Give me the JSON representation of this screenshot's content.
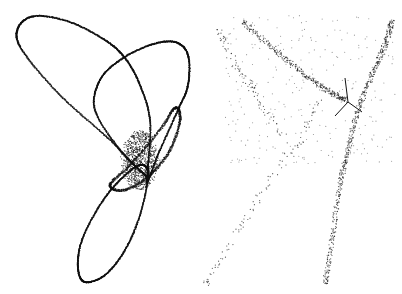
{
  "chart_data": [
    {
      "type": "scatter",
      "title": "",
      "xlabel": "",
      "ylabel": "",
      "grid": false,
      "legend": null,
      "description": "Dense point cloud tracing a three-lobed loop (trefoil-like attractor) with a dark dense core",
      "point_color": "#111111",
      "background": "#ffffff",
      "curves": [
        {
          "name": "upper-left-lobe",
          "points": [
            [
              145,
              175
            ],
            [
              110,
              140
            ],
            [
              60,
              95
            ],
            [
              22,
              50
            ],
            [
              18,
              28
            ],
            [
              35,
              16
            ],
            [
              70,
              22
            ],
            [
              105,
              40
            ],
            [
              125,
              58
            ],
            [
              140,
              85
            ],
            [
              150,
              120
            ],
            [
              148,
              165
            ]
          ]
        },
        {
          "name": "upper-right-lobe",
          "points": [
            [
              145,
              175
            ],
            [
              120,
              150
            ],
            [
              95,
              110
            ],
            [
              100,
              80
            ],
            [
              120,
              60
            ],
            [
              150,
              45
            ],
            [
              175,
              42
            ],
            [
              188,
              55
            ],
            [
              188,
              85
            ],
            [
              178,
              110
            ],
            [
              160,
              150
            ],
            [
              148,
              180
            ]
          ]
        },
        {
          "name": "lower-lobe",
          "points": [
            [
              148,
              175
            ],
            [
              140,
              215
            ],
            [
              125,
              250
            ],
            [
              105,
              275
            ],
            [
              85,
              282
            ],
            [
              78,
              268
            ],
            [
              82,
              240
            ],
            [
              100,
              205
            ],
            [
              120,
              180
            ],
            [
              140,
              165
            ]
          ]
        },
        {
          "name": "inner-loop",
          "points": [
            [
              110,
              185
            ],
            [
              130,
              165
            ],
            [
              160,
              130
            ],
            [
              175,
              108
            ],
            [
              180,
              120
            ],
            [
              170,
              150
            ],
            [
              150,
              175
            ],
            [
              125,
              190
            ]
          ]
        }
      ],
      "dense_core": {
        "x": 140,
        "y": 160,
        "rx": 20,
        "ry": 30
      }
    },
    {
      "type": "scatter",
      "title": "",
      "xlabel": "",
      "ylabel": "",
      "grid": false,
      "legend": null,
      "description": "Sparse point cloud forming a V / branching shape with a Y-shaped dark junction",
      "point_color": "#111111",
      "background": "#ffffff",
      "curves": [
        {
          "name": "upper-left-arm",
          "points": [
            [
              243,
              22
            ],
            [
              275,
              50
            ],
            [
              305,
              75
            ],
            [
              330,
              92
            ],
            [
              345,
              100
            ]
          ]
        },
        {
          "name": "upper-right-arm",
          "points": [
            [
              392,
              22
            ],
            [
              385,
              45
            ],
            [
              372,
              75
            ],
            [
              358,
              110
            ],
            [
              348,
              150
            ],
            [
              340,
              185
            ],
            [
              332,
              240
            ],
            [
              325,
              285
            ]
          ]
        },
        {
          "name": "left-diagonal",
          "points": [
            [
              320,
              100
            ],
            [
              300,
              140
            ],
            [
              270,
              180
            ],
            [
              245,
              220
            ],
            [
              220,
              260
            ],
            [
              205,
              285
            ]
          ]
        },
        {
          "name": "left-sparse",
          "points": [
            [
              220,
              30
            ],
            [
              230,
              55
            ],
            [
              250,
              85
            ],
            [
              265,
              110
            ],
            [
              285,
              140
            ]
          ]
        }
      ],
      "y_junction": {
        "center": [
          348,
          102
        ],
        "arms": [
          [
            [
              348,
              102
            ],
            [
              345,
              78
            ]
          ],
          [
            [
              348,
              102
            ],
            [
              335,
              116
            ]
          ],
          [
            [
              348,
              102
            ],
            [
              362,
              112
            ]
          ]
        ]
      }
    }
  ]
}
